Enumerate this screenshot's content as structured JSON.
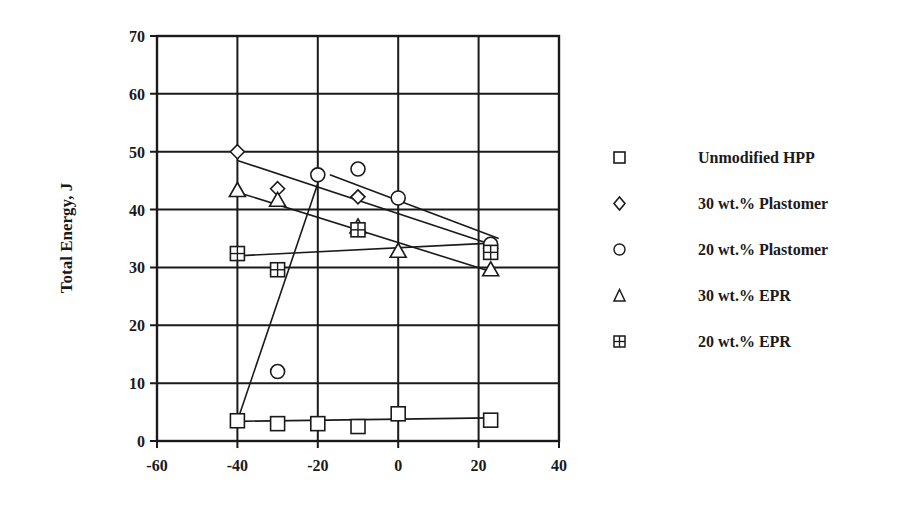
{
  "chart_data": {
    "type": "scatter",
    "title": "",
    "xlabel": "",
    "ylabel": "Total Energy, J",
    "xlim": [
      -60,
      40
    ],
    "ylim": [
      0,
      70
    ],
    "xticks": [
      -60,
      -40,
      -20,
      0,
      20,
      40
    ],
    "yticks": [
      0,
      10,
      20,
      30,
      40,
      50,
      60,
      70
    ],
    "grid": true,
    "legend_position": "right",
    "series": [
      {
        "name": "Unmodified HPP",
        "marker": "square",
        "x": [
          -40,
          -30,
          -20,
          -10,
          0,
          23
        ],
        "y": [
          3.5,
          3.0,
          3.0,
          2.5,
          4.7,
          3.6
        ],
        "trendline": [
          [
            -40,
            3.4
          ],
          [
            23,
            4.0
          ]
        ]
      },
      {
        "name": "30 wt.% Plastomer",
        "marker": "diamond",
        "x": [
          -40,
          -30,
          -10,
          23
        ],
        "y": [
          50.0,
          43.6,
          42.2,
          33.3
        ],
        "trendline": [
          [
            -40,
            48.5
          ],
          [
            23,
            34.0
          ]
        ]
      },
      {
        "name": "20 wt.% Plastomer",
        "marker": "circle",
        "x": [
          -30,
          -20,
          -10,
          0,
          23
        ],
        "y": [
          12.0,
          46.0,
          47.0,
          42.0,
          34.0
        ],
        "trendline": [
          [
            -17,
            46.0
          ],
          [
            25,
            35.0
          ]
        ],
        "trendline2": [
          [
            -40,
            3.5
          ],
          [
            -20,
            44.5
          ]
        ]
      },
      {
        "name": "30 wt.% EPR",
        "marker": "triangle",
        "x": [
          -40,
          -30,
          -10,
          0,
          23
        ],
        "y": [
          43.3,
          41.6,
          37.0,
          32.8,
          29.6
        ],
        "trendline": [
          [
            -40,
            43.0
          ],
          [
            23,
            29.3
          ]
        ]
      },
      {
        "name": "20 wt.% EPR",
        "marker": "square-cross",
        "x": [
          -40,
          -30,
          -10,
          23
        ],
        "y": [
          32.4,
          29.6,
          36.5,
          32.6
        ],
        "trendline": [
          [
            -40,
            32.0
          ],
          [
            23,
            34.2
          ]
        ]
      }
    ]
  },
  "legend": {
    "items": [
      {
        "label": "Unmodified HPP",
        "marker": "square"
      },
      {
        "label": "30 wt.% Plastomer",
        "marker": "diamond"
      },
      {
        "label": "20 wt.% Plastomer",
        "marker": "circle"
      },
      {
        "label": "30 wt.% EPR",
        "marker": "triangle"
      },
      {
        "label": "20 wt.% EPR",
        "marker": "square-cross"
      }
    ]
  },
  "colors": {
    "ink": "#1a1a1a",
    "background": "#ffffff"
  }
}
